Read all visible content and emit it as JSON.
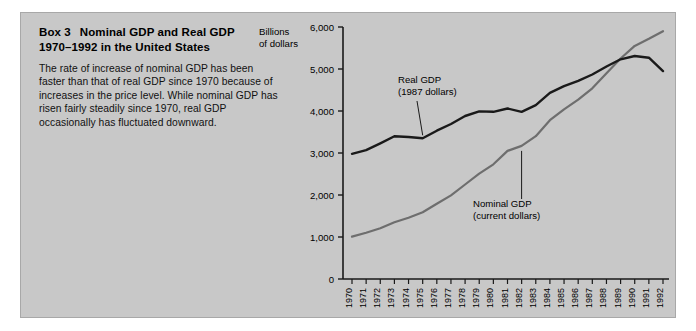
{
  "panel": {
    "background_color": "#c8c8c8"
  },
  "box": {
    "label": "Box 3",
    "title_line1": "Nominal GDP and Real GDP",
    "title_line2": "1970–1992 in the United States",
    "body": "The rate of increase of nominal GDP has been faster than that of real GDP since 1970 because of increases in the price level. While nominal GDP has risen fairly steadily since 1970, real GDP occasionally has fluctuated downward."
  },
  "chart_data": {
    "type": "line",
    "title": "Nominal GDP and Real GDP 1970–1992 in the United States",
    "xlabel": "",
    "ylabel": "Billions of dollars",
    "ylabel_line1": "Billions",
    "ylabel_line2": "of dollars",
    "ylim": [
      0,
      6000
    ],
    "yticks": [
      0,
      1000,
      2000,
      3000,
      4000,
      5000,
      6000
    ],
    "ytick_labels": [
      "0",
      "1,000",
      "2,000",
      "3,000",
      "4,000",
      "5,000",
      "6,000"
    ],
    "grid": false,
    "legend": "inline-annotations",
    "x": [
      1970,
      1971,
      1972,
      1973,
      1974,
      1975,
      1976,
      1977,
      1978,
      1979,
      1980,
      1981,
      1982,
      1983,
      1984,
      1985,
      1986,
      1987,
      1988,
      1989,
      1990,
      1991,
      1992
    ],
    "xtick_labels": [
      "1970",
      "1971",
      "1972",
      "1973",
      "1974",
      "1975",
      "1976",
      "1977",
      "1978",
      "1979",
      "1980",
      "1981",
      "1982",
      "1983",
      "1984",
      "1985",
      "1986",
      "1987",
      "1988",
      "1989",
      "1990",
      "1991",
      "1992"
    ],
    "series": [
      {
        "name": "Real GDP",
        "units": "1987 dollars",
        "label_line1": "Real GDP",
        "label_line2": "(1987 dollars)",
        "color": "#1a1a1a",
        "values": [
          2980,
          3070,
          3230,
          3400,
          3380,
          3350,
          3530,
          3690,
          3880,
          3990,
          3980,
          4060,
          3980,
          4140,
          4430,
          4590,
          4720,
          4870,
          5060,
          5230,
          5310,
          5270,
          4950
        ]
      },
      {
        "name": "Nominal GDP",
        "units": "current dollars",
        "label_line1": "Nominal GDP",
        "label_line2": "(current dollars)",
        "color": "#6e6e6e",
        "values": [
          1010,
          1100,
          1210,
          1350,
          1460,
          1590,
          1790,
          1990,
          2250,
          2510,
          2730,
          3050,
          3170,
          3400,
          3780,
          4040,
          4270,
          4540,
          4900,
          5250,
          5550,
          5720,
          5900
        ]
      }
    ],
    "annotations": [
      {
        "text": "Real GDP (1987 dollars)",
        "attached_to": "Real GDP"
      },
      {
        "text": "Nominal GDP (current dollars)",
        "attached_to": "Nominal GDP"
      }
    ]
  }
}
